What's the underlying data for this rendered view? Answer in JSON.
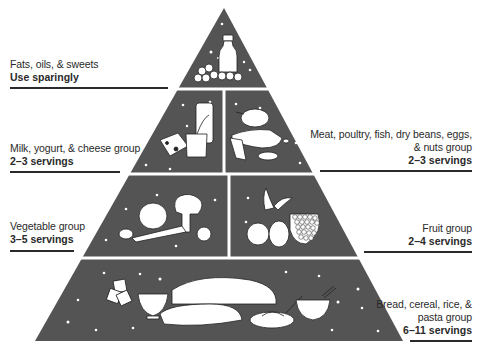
{
  "colors": {
    "pyramid_fill": "#545454",
    "divider": "#ffffff",
    "text": "#2a2a2a",
    "rule": "#2a2a2a"
  },
  "tiers": [
    {
      "id": "fats",
      "name": "Fats, oils, & sweets",
      "servings": "Use sparingly",
      "side": "left",
      "illustration": "bottle and candies"
    },
    {
      "id": "milk",
      "name": "Milk, yogurt, & cheese group",
      "servings": "2–3 servings",
      "side": "left",
      "illustration": "cheese, glass of milk, yogurt cup"
    },
    {
      "id": "meat",
      "name_line1": "Meat, poultry, fish, dry beans, eggs,",
      "name_line2": "& nuts group",
      "servings": "2–3 servings",
      "side": "right",
      "illustration": "chicken, fish, beans, nuts"
    },
    {
      "id": "vegetable",
      "name": "Vegetable group",
      "servings": "3–5 servings",
      "side": "left",
      "illustration": "cabbage, broccoli, carrot, tomato"
    },
    {
      "id": "fruit",
      "name": "Fruit group",
      "servings": "2–4 servings",
      "side": "right",
      "illustration": "apples, banana, grapes"
    },
    {
      "id": "bread",
      "name_line1": "Bread, cereal, rice, &",
      "name_line2": "pasta group",
      "servings": "6–11 servings",
      "side": "right",
      "illustration": "crackers, cereal bowl, bread loaves, pasta, rice bowl"
    }
  ]
}
